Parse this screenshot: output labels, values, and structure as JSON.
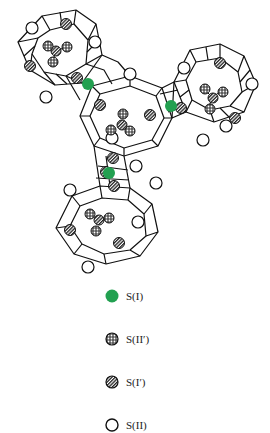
{
  "figure": {
    "colors": {
      "site_SI": "#22a050",
      "line": "#111111",
      "background": "#ffffff"
    }
  },
  "legend": {
    "items": [
      {
        "symbol": "filled-green-circle",
        "label": "S(I)"
      },
      {
        "symbol": "dotted-hatched-circle",
        "label": "S(II′)"
      },
      {
        "symbol": "striped-hatched-circle",
        "label": "S(I′)"
      },
      {
        "symbol": "open-circle",
        "label": "S(II)"
      }
    ]
  }
}
